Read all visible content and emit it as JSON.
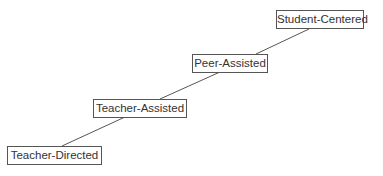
{
  "diagram": {
    "type": "staircase-progression",
    "steps": [
      {
        "label": "Teacher-Directed"
      },
      {
        "label": "Teacher-Assisted"
      },
      {
        "label": "Peer-Assisted"
      },
      {
        "label": "Student-Centered"
      }
    ],
    "colors": {
      "line": "#555555",
      "text": "#333333",
      "border": "#555555"
    }
  }
}
